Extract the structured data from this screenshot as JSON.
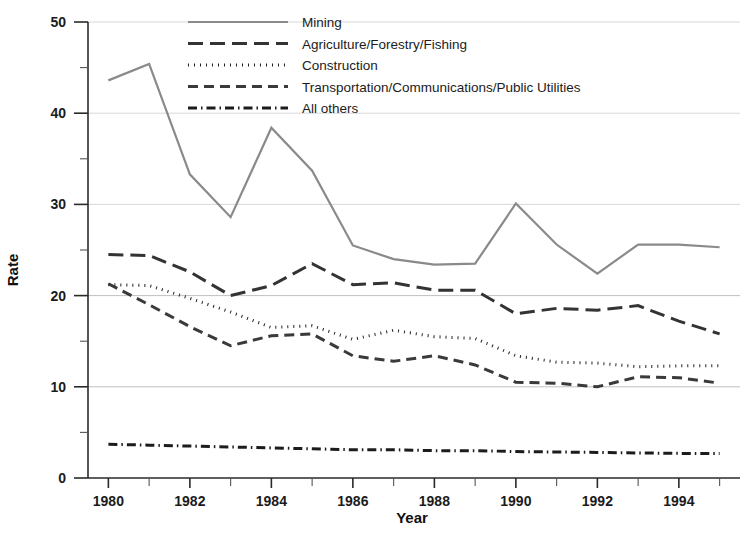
{
  "chart_data": {
    "type": "line",
    "title": "",
    "xlabel": "Year",
    "ylabel": "Rate",
    "xlim": [
      1979.5,
      1995.5
    ],
    "ylim": [
      0,
      50
    ],
    "grid": true,
    "legend_position": "top-center",
    "x": [
      1980,
      1981,
      1982,
      1983,
      1984,
      1985,
      1986,
      1987,
      1988,
      1989,
      1990,
      1991,
      1992,
      1993,
      1994,
      1995
    ],
    "x_tick_labels": [
      "1980",
      "1982",
      "1984",
      "1986",
      "1988",
      "1990",
      "1992",
      "1994"
    ],
    "x_ticks": [
      1980,
      1982,
      1984,
      1986,
      1988,
      1990,
      1992,
      1994
    ],
    "y_ticks": [
      0,
      10,
      20,
      30,
      40,
      50
    ],
    "y_minor_ticks": [
      5,
      15,
      25,
      35,
      45
    ],
    "y_tick_labels": [
      "0",
      "10",
      "20",
      "30",
      "40",
      "50"
    ],
    "categories": [
      "1980",
      "1981",
      "1982",
      "1983",
      "1984",
      "1985",
      "1986",
      "1987",
      "1988",
      "1989",
      "1990",
      "1991",
      "1992",
      "1993",
      "1994",
      "1995"
    ],
    "series": [
      {
        "name": "Mining",
        "style": "solid",
        "color": "#8a8a8a",
        "width": 2.2,
        "dasharray": "",
        "values": [
          43.6,
          45.4,
          33.3,
          28.6,
          38.4,
          33.7,
          25.5,
          24.0,
          23.4,
          23.5,
          30.1,
          25.6,
          22.4,
          25.6,
          25.6,
          25.3
        ]
      },
      {
        "name": "Agriculture/Forestry/Fishing",
        "style": "long-dash",
        "color": "#333333",
        "width": 3.0,
        "dasharray": "15,7",
        "values": [
          24.5,
          24.4,
          22.6,
          20.0,
          21.1,
          23.5,
          21.2,
          21.4,
          20.6,
          20.6,
          18.0,
          18.6,
          18.4,
          18.9,
          17.2,
          15.8
        ]
      },
      {
        "name": "Construction",
        "style": "dotted",
        "color": "#222222",
        "width": 3.0,
        "dasharray": "1,5",
        "values": [
          21.2,
          21.1,
          19.7,
          18.2,
          16.5,
          16.7,
          15.2,
          16.2,
          15.5,
          15.3,
          13.4,
          12.7,
          12.6,
          12.2,
          12.3,
          12.3
        ]
      },
      {
        "name": "Transportation/Communications/Public Utilities",
        "style": "dash",
        "color": "#3a3a3a",
        "width": 3.0,
        "dasharray": "10,6",
        "values": [
          21.3,
          19.0,
          16.6,
          14.5,
          15.6,
          15.8,
          13.4,
          12.8,
          13.4,
          12.4,
          10.5,
          10.4,
          10.0,
          11.1,
          11.0,
          10.4
        ]
      },
      {
        "name": "All others",
        "style": "dash-dot",
        "color": "#1c1c1c",
        "width": 3.0,
        "dasharray": "9,4,1.5,4",
        "values": [
          3.7,
          3.6,
          3.5,
          3.4,
          3.3,
          3.2,
          3.1,
          3.1,
          3.0,
          3.0,
          2.9,
          2.85,
          2.8,
          2.75,
          2.7,
          2.7
        ]
      }
    ]
  },
  "axes": {
    "y_axis_title": "Rate",
    "x_axis_title": "Year"
  },
  "legend": {
    "entries": [
      {
        "label": "Mining"
      },
      {
        "label": "Agriculture/Forestry/Fishing"
      },
      {
        "label": "Construction"
      },
      {
        "label": "Transportation/Communications/Public Utilities"
      },
      {
        "label": "All others"
      }
    ]
  }
}
